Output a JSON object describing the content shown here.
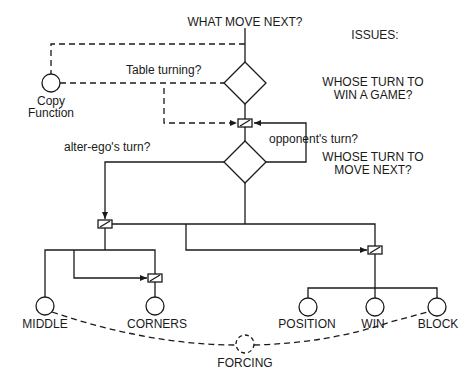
{
  "diagram": {
    "title": "WHAT MOVE NEXT?",
    "issues_heading": "ISSUES:",
    "issues": [
      {
        "line1": "WHOSE TURN TO",
        "line2": "WIN A GAME?"
      },
      {
        "line1": "WHOSE TURN TO",
        "line2": "MOVE NEXT?"
      }
    ],
    "copy_function": {
      "line1": "Copy",
      "line2": "Function"
    },
    "edge_labels": {
      "table_turning": "Table turning?",
      "opponents_turn": "opponent's turn?",
      "alter_egos_turn": "alter-ego's turn?"
    },
    "leaf_nodes": [
      "MIDDLE",
      "CORNERS",
      "POSITION",
      "WIN",
      "BLOCK"
    ],
    "forcing_node": "FORCING",
    "colors": {
      "line": "#1a1a1a",
      "background": "#ffffff"
    }
  }
}
